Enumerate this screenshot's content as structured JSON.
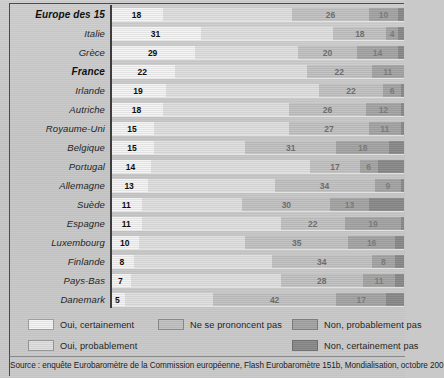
{
  "chart_data": {
    "type": "bar",
    "orientation": "horizontal",
    "stacked": true,
    "title": "",
    "xlabel": "",
    "ylabel": "",
    "xlim": [
      0,
      100
    ],
    "grid": false,
    "legend_position": "bottom",
    "categories": [
      "Europe des 15",
      "Italie",
      "Grèce",
      "France",
      "Irlande",
      "Autriche",
      "Royaume-Uni",
      "Belgique",
      "Portugal",
      "Allemagne",
      "Suède",
      "Espagne",
      "Luxembourg",
      "Finlande",
      "Pays-Bas",
      "Danemark"
    ],
    "highlighted_categories": [
      "Europe des 15",
      "France"
    ],
    "series": [
      {
        "name": "Oui, certainement",
        "values": [
          18,
          31,
          29,
          22,
          19,
          18,
          15,
          15,
          14,
          13,
          11,
          11,
          10,
          8,
          7,
          5
        ]
      },
      {
        "name": "Oui, probablement",
        "values": [
          44,
          45,
          35,
          45,
          52,
          43,
          46,
          31,
          54,
          43,
          34,
          47,
          36,
          47,
          51,
          30
        ]
      },
      {
        "name": "Ne se prononcent pas",
        "values": [
          26,
          18,
          20,
          22,
          22,
          26,
          27,
          31,
          17,
          34,
          30,
          22,
          35,
          34,
          28,
          42
        ]
      },
      {
        "name": "Non, probablement pas",
        "values": [
          10,
          4,
          14,
          11,
          6,
          12,
          11,
          18,
          6,
          9,
          13,
          19,
          16,
          8,
          11,
          17
        ]
      },
      {
        "name": "Non, certainement pas",
        "values": [
          2,
          2,
          2,
          0,
          1,
          1,
          1,
          5,
          9,
          1,
          12,
          1,
          3,
          3,
          3,
          6
        ]
      }
    ],
    "legend": [
      "Oui, certainement",
      "Oui, probablement",
      "Ne se prononcent pas",
      "Non, probablement pas",
      "Non, certainement pas"
    ],
    "source": "Source : enquête Eurobaromètre de la Commission européenne, Flash Eurobaromètre 151b, Mondialisation, octobre 200"
  },
  "colors": {
    "seg0": "#eaeaea",
    "seg1": "#d9d9d9",
    "seg2": "#bdbdbd",
    "seg3": "#a2a2a2",
    "seg4": "#888888",
    "axis": "#3d3d3d",
    "paper": "#c9c9c9"
  }
}
